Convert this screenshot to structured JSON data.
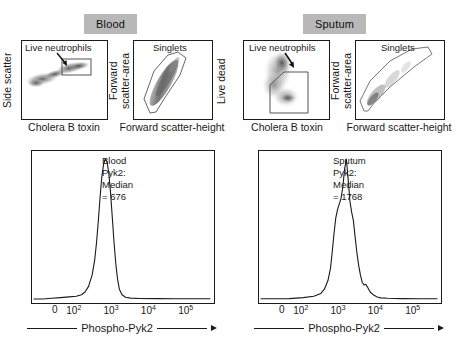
{
  "figure": {
    "groups": [
      {
        "label": "Blood"
      },
      {
        "label": "Sputum"
      }
    ]
  },
  "scatter_panels": [
    {
      "name": "blood-live-neutrophils",
      "ylabel": "Side scatter",
      "xlabel": "Cholera B toxin",
      "gate_label": "Live neutrophils"
    },
    {
      "name": "blood-singlets",
      "ylabel": "Forward\nscatter-area",
      "xlabel": "Forward scatter-height",
      "gate_label": "Singlets"
    },
    {
      "name": "sputum-live-neutrophils",
      "ylabel": "Live dead",
      "xlabel": "Cholera B toxin",
      "gate_label": "Live neutrophils"
    },
    {
      "name": "sputum-singlets",
      "ylabel": "Forward\nscatter-area",
      "xlabel": "Forward scatter-height",
      "gate_label": "Singlets"
    }
  ],
  "chart_data": [
    {
      "type": "line",
      "name": "blood-phospho-pyk2-histogram",
      "title": "Blood Pyk2:\nMedian = 676",
      "annotation_lines": [
        "Blood Pyk2:",
        "Median = 676"
      ],
      "median": 676,
      "xlabel": "Phospho-Pyk2",
      "ylabel": "",
      "grid": false,
      "legend": "none",
      "xticks": [
        "0",
        "10^2",
        "10^3",
        "10^4",
        "10^5"
      ],
      "xtick_positions": [
        0.13,
        0.235,
        0.44,
        0.645,
        0.85
      ],
      "x": [
        0.0,
        0.05,
        0.1,
        0.15,
        0.2,
        0.24,
        0.27,
        0.29,
        0.31,
        0.33,
        0.345,
        0.355,
        0.365,
        0.375,
        0.385,
        0.395,
        0.405,
        0.415,
        0.425,
        0.435,
        0.445,
        0.455,
        0.465,
        0.475,
        0.485,
        0.5,
        0.52,
        0.55,
        0.6,
        0.7,
        0.8,
        0.9,
        1.0
      ],
      "y": [
        0.0,
        0.0,
        0.005,
        0.01,
        0.015,
        0.02,
        0.03,
        0.05,
        0.09,
        0.17,
        0.28,
        0.4,
        0.55,
        0.72,
        0.87,
        0.96,
        1.0,
        0.98,
        0.9,
        0.76,
        0.58,
        0.4,
        0.25,
        0.14,
        0.07,
        0.03,
        0.012,
        0.006,
        0.004,
        0.003,
        0.002,
        0.002,
        0.002
      ]
    },
    {
      "type": "line",
      "name": "sputum-phospho-pyk2-histogram",
      "title": "Sputum Pyk2:\nMedian = 1768",
      "annotation_lines": [
        "Sputum Pyk2:",
        "Median = 1768"
      ],
      "median": 1768,
      "xlabel": "Phospho-Pyk2",
      "ylabel": "",
      "grid": false,
      "legend": "none",
      "xticks": [
        "0",
        "10^2",
        "10^3",
        "10^4",
        "10^5"
      ],
      "xtick_positions": [
        0.13,
        0.235,
        0.44,
        0.645,
        0.85
      ],
      "x": [
        0.0,
        0.08,
        0.16,
        0.24,
        0.3,
        0.34,
        0.36,
        0.38,
        0.395,
        0.405,
        0.415,
        0.425,
        0.435,
        0.445,
        0.455,
        0.465,
        0.475,
        0.485,
        0.495,
        0.505,
        0.515,
        0.525,
        0.535,
        0.545,
        0.555,
        0.565,
        0.575,
        0.585,
        0.595,
        0.605,
        0.62,
        0.64,
        0.66,
        0.68,
        0.72,
        0.8,
        0.9,
        1.0
      ],
      "y": [
        0.002,
        0.002,
        0.003,
        0.01,
        0.02,
        0.04,
        0.07,
        0.13,
        0.22,
        0.34,
        0.47,
        0.58,
        0.64,
        0.68,
        0.72,
        0.8,
        0.93,
        1.0,
        0.86,
        0.7,
        0.62,
        0.56,
        0.44,
        0.33,
        0.24,
        0.17,
        0.12,
        0.1,
        0.105,
        0.085,
        0.05,
        0.028,
        0.014,
        0.008,
        0.005,
        0.003,
        0.002,
        0.002
      ]
    }
  ],
  "histograms_meta": {
    "xaxis_name": "Phospho-Pyk2",
    "arrow": "right-arrow"
  },
  "colors": {
    "badge_background": "#b8b8b8",
    "ink": "#1a1a1a",
    "density_dark": "#6b6b6b",
    "density_light": "#c9c9c9",
    "gate_outline": "#555555"
  }
}
